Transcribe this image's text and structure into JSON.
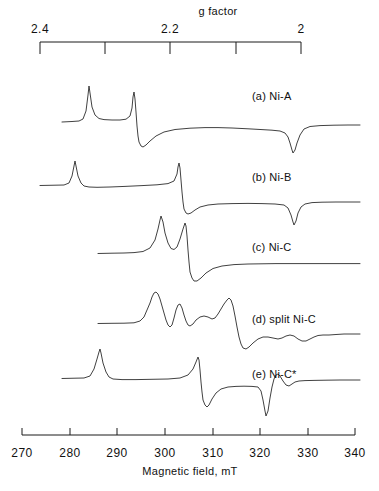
{
  "figure": {
    "background": "#ffffff",
    "trace_color": "#2b2b2b",
    "axis_color": "#1a1a1a"
  },
  "top_axis": {
    "title": "g factor",
    "title_x": 218,
    "title_y": 10,
    "bracket_y": 42,
    "bracket_x_start": 40,
    "bracket_x_end": 301,
    "tick_drop": 12,
    "ticks": [
      {
        "label": "2.4",
        "x": 40,
        "show_label": true
      },
      {
        "label": "",
        "x": 105,
        "show_label": false
      },
      {
        "label": "2.2",
        "x": 170,
        "show_label": true
      },
      {
        "label": "",
        "x": 236,
        "show_label": false
      },
      {
        "label": "2",
        "x": 301,
        "show_label": true
      }
    ],
    "label_y": 24
  },
  "bottom_axis": {
    "title": "Magnetic field, mT",
    "title_x": 190,
    "title_y": 470,
    "axis_y": 435,
    "x_start": 22,
    "x_end": 355,
    "tick_height": 7,
    "label_y": 446,
    "ticks": [
      {
        "label": "270",
        "x": 22
      },
      {
        "label": "280",
        "x": 70
      },
      {
        "label": "290",
        "x": 117
      },
      {
        "label": "300",
        "x": 165
      },
      {
        "label": "310",
        "x": 213
      },
      {
        "label": "320",
        "x": 260
      },
      {
        "label": "330",
        "x": 308
      },
      {
        "label": "340",
        "x": 355
      }
    ],
    "range_min": 270,
    "range_max": 340,
    "units": "mT"
  },
  "spectra": [
    {
      "id": "a",
      "label": "(a) Ni-A",
      "label_x": 252,
      "label_y": 97,
      "baseline_y": 122,
      "path": "M 62,122 L 72,121.5 L 79,121 L 83,119 L 86,111 L 88,95 L 89,86 L 90,93 L 92,107 L 95,115 L 99,118.5 L 104,119.6 L 112,120 L 120,120 L 126,119.2 L 130,116 L 132,108 L 133,97 L 134,92 L 135,99 L 136,112 L 137,126 L 138,136 L 139,142 L 141,146 L 143,147 L 146,145 L 150,141 L 156,136 L 164,132 L 175,129.5 L 190,128.2 L 205,127.6 L 218,127.6 L 232,128 L 248,128.8 L 262,129.6 L 272,130.2 L 280,131 L 285,133 L 288,137 L 290,143 L 292,150 L 293,153 L 295,150 L 297,143 L 300,135 L 304,129 L 310,126.5 L 320,125.6 L 334,125.2 L 348,125 L 360,125"
    },
    {
      "id": "b",
      "label": "(b) Ni-B",
      "label_x": 252,
      "label_y": 178,
      "baseline_y": 185,
      "path": "M 40,185.5 L 55,185.2 L 64,185 L 69,183 L 72,176 L 74,166 L 75,161 L 76,166 L 78,176 L 81,183 L 84,186 L 89,187 L 97,187.3 L 110,187 L 125,186.4 L 142,185.6 L 157,184.8 L 168,183.6 L 174,181 L 177,174 L 178,167 L 179,163 L 180,168 L 181,180 L 182,192 L 183,202 L 184,209 L 186,213 L 188,214 L 191,213 L 195,210 L 200,207 L 208,205 L 218,204 L 232,203.6 L 248,203.4 L 262,203.6 L 275,204 L 284,205 L 288,208 L 291,215 L 293,222 L 294,225 L 296,221 L 298,213 L 301,207 L 305,204 L 312,202.6 L 322,202.2 L 336,202 L 350,202 L 360,202"
    },
    {
      "id": "c",
      "label": "(c) Ni-C",
      "label_x": 252,
      "label_y": 248,
      "baseline_y": 253,
      "path": "M 98,253.5 L 112,253.2 L 124,253 L 134,252.6 L 143,251.5 L 150,248 L 155,240 L 158,229 L 160,220 L 161,216 L 163,222 L 165,233 L 168,243 L 171,248.5 L 174,249.5 L 177,247 L 180,239 L 183,229 L 185,223 L 186,226 L 187,236 L 188,250 L 189,262 L 190,272 L 192,278 L 194,281 L 197,281 L 201,278 L 206,273 L 213,268.5 L 222,266 L 234,264.6 L 248,264 L 262,263.8 L 276,263.6 L 292,263.6 L 310,263.6 L 330,263.6 L 350,263.6 L 360,263.6"
    },
    {
      "id": "d",
      "label": "(d) split Ni-C",
      "label_x": 252,
      "label_y": 320,
      "baseline_y": 323,
      "path": "M 98,323.5 L 112,323.3 L 124,323.2 L 134,322.8 L 140,321 L 144,317 L 147,310 L 150,303 L 152,297 L 154,293 L 156,292 L 158,294 L 160,299 L 162,306 L 164,313 L 166,320 L 168,325 L 170,327 L 172,325 L 174,318 L 176,310 L 178,305 L 180,304 L 182,308 L 184,315 L 186,321 L 188,325 L 190,326 L 193,324 L 196,320 L 200,317 L 204,316 L 208,317 L 212,319 L 215,318 L 218,314 L 221,309 L 224,304 L 227,300 L 229,298 L 231,300 L 233,306 L 235,316 L 237,327 L 239,337 L 241,344 L 243,348 L 246,349 L 249,347 L 253,343 L 258,339 L 263,337 L 268,337 L 273,338 L 278,339 L 282,338 L 286,336 L 290,335 L 294,336 L 298,339 L 302,341 L 306,341 L 310,339 L 314,337 L 318,335.5 L 323,335 L 329,335 L 336,334.5 L 344,334 L 352,334 L 360,334"
    },
    {
      "id": "e",
      "label": "(e) Ni-C*",
      "label_x": 252,
      "label_y": 375,
      "baseline_y": 378,
      "path": "M 62,378.5 L 75,378.2 L 84,378 L 90,376 L 94,369 L 97,359 L 99,352 L 100,349 L 101,353 L 103,363 L 106,372 L 109,377 L 113,379 L 122,379.6 L 136,379.6 L 152,379.3 L 168,379 L 180,378 L 188,375 L 193,369 L 196,362 L 198,357 L 199,360 L 200,370 L 201,382 L 202,392 L 203,400 L 205,405 L 207,407 L 209,405 L 212,399 L 216,393 L 221,389 L 228,387 L 236,386.4 L 244,386.2 L 252,386.4 L 258,387 L 261,391 L 263,400 L 265,411 L 266,416 L 268,411 L 270,398 L 272,387 L 274,379 L 276,375 L 278,374 L 280,376 L 283,381 L 286,385 L 289,386 L 292,384 L 295,382 L 299,381 L 305,380.6 L 314,380.4 L 326,380.2 L 340,380 L 352,380 L 360,380"
    }
  ]
}
